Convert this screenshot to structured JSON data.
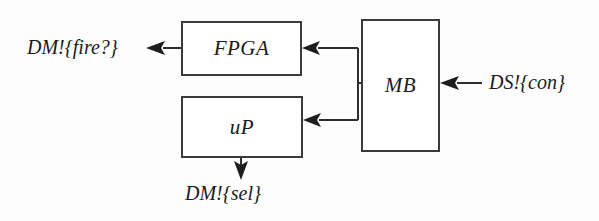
{
  "diagram": {
    "background_color": "#fdfdfd",
    "line_color": "#2e2e2e",
    "text_color": "#1a1a1a",
    "blocks": [
      {
        "id": "fpga",
        "label": "FPGA"
      },
      {
        "id": "up",
        "label": "uP"
      },
      {
        "id": "mb",
        "label": "MB"
      }
    ],
    "signals": [
      {
        "id": "fire",
        "label": "DM!{fire?}",
        "direction": "out",
        "from": "fpga",
        "orientation": "left"
      },
      {
        "id": "con",
        "label": "DS!{con}",
        "direction": "in",
        "to": "mb",
        "orientation": "left"
      },
      {
        "id": "sel",
        "label": "DM!{sel}",
        "direction": "out",
        "from": "up",
        "orientation": "down"
      }
    ],
    "connections": [
      {
        "from": "mb",
        "to": "fpga",
        "style": "elbow",
        "arrow": "left"
      },
      {
        "from": "mb",
        "to": "up",
        "style": "elbow",
        "arrow": "left"
      }
    ]
  }
}
